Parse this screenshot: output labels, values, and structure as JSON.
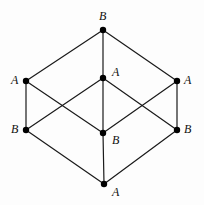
{
  "figure": {
    "kind": "graph-diagram",
    "background_color": "#fdfdfd",
    "stroke_color": "#1a1a1a",
    "vertex_color": "#000000",
    "edge_width": 1.2,
    "vertex_radius": 3.2,
    "width": 204,
    "height": 205,
    "vertices": [
      {
        "id": "top",
        "label": "B",
        "x": 103,
        "y": 30,
        "label_x": 99,
        "label_y": 10,
        "label_anchor": "above"
      },
      {
        "id": "left-upper",
        "label": "A",
        "x": 26,
        "y": 81,
        "label_x": 11,
        "label_y": 74,
        "label_anchor": "left"
      },
      {
        "id": "center-upper",
        "label": "A",
        "x": 103,
        "y": 78,
        "label_x": 112,
        "label_y": 66,
        "label_anchor": "right"
      },
      {
        "id": "right-upper",
        "label": "A",
        "x": 177,
        "y": 81,
        "label_x": 184,
        "label_y": 74,
        "label_anchor": "right"
      },
      {
        "id": "left-lower",
        "label": "B",
        "x": 26,
        "y": 130,
        "label_x": 11,
        "label_y": 123,
        "label_anchor": "left"
      },
      {
        "id": "center-lower",
        "label": "B",
        "x": 103,
        "y": 133,
        "label_x": 112,
        "label_y": 134,
        "label_anchor": "right"
      },
      {
        "id": "right-lower",
        "label": "B",
        "x": 177,
        "y": 130,
        "label_x": 184,
        "label_y": 123,
        "label_anchor": "right"
      },
      {
        "id": "bottom",
        "label": "A",
        "x": 104,
        "y": 184,
        "label_x": 112,
        "label_y": 186,
        "label_anchor": "below-right"
      }
    ],
    "edges": [
      {
        "from": "top",
        "to": "left-upper",
        "kind": "outline"
      },
      {
        "from": "top",
        "to": "right-upper",
        "kind": "outline"
      },
      {
        "from": "top",
        "to": "center-upper",
        "kind": "vertical"
      },
      {
        "from": "left-upper",
        "to": "left-lower",
        "kind": "vertical"
      },
      {
        "from": "right-upper",
        "to": "right-lower",
        "kind": "vertical"
      },
      {
        "from": "center-upper",
        "to": "center-lower",
        "kind": "vertical"
      },
      {
        "from": "left-upper",
        "to": "center-lower",
        "kind": "crossing"
      },
      {
        "from": "left-lower",
        "to": "center-upper",
        "kind": "crossing"
      },
      {
        "from": "center-upper",
        "to": "right-lower",
        "kind": "crossing"
      },
      {
        "from": "center-lower",
        "to": "right-upper",
        "kind": "crossing"
      },
      {
        "from": "bottom",
        "to": "left-lower",
        "kind": "outline"
      },
      {
        "from": "bottom",
        "to": "right-lower",
        "kind": "outline"
      },
      {
        "from": "bottom",
        "to": "center-lower",
        "kind": "vertical"
      }
    ]
  }
}
